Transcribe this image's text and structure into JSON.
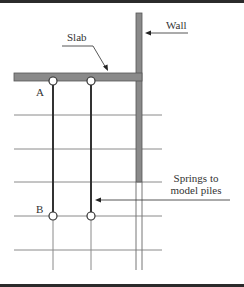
{
  "diagram": {
    "labels": {
      "wall": "Wall",
      "slab": "Slab",
      "node_a": "A",
      "node_b": "B",
      "springs_line1": "Springs to",
      "springs_line2": "model piles"
    },
    "colors": {
      "member_fill": "#8a8a8a",
      "member_stroke": "#555555",
      "grid_line": "#808080",
      "pile_line": "#333333",
      "node_fill": "#ffffff",
      "border": "#2b2b2b"
    },
    "grid_rows_y": [
      115,
      149,
      182,
      216,
      250
    ],
    "pile_columns_x": [
      53,
      91
    ]
  }
}
